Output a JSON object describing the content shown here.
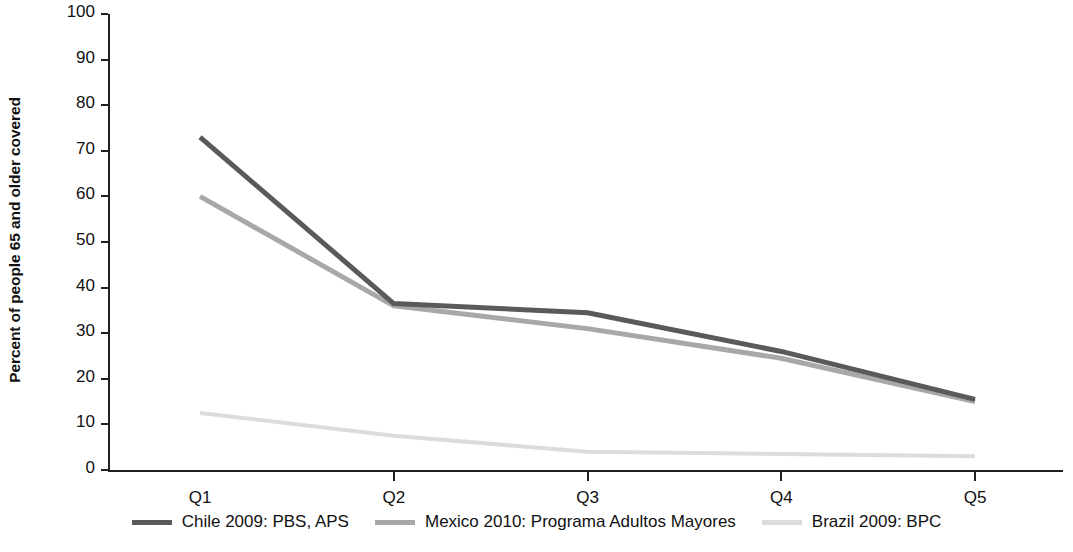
{
  "chart_data": {
    "type": "line",
    "title": "",
    "subtitle": "",
    "xlabel": "",
    "ylabel": "Percent of people 65 and older covered",
    "categories": [
      "Q1",
      "Q2",
      "Q3",
      "Q4",
      "Q5"
    ],
    "ylim": [
      0,
      100
    ],
    "yticks": [
      0,
      10,
      20,
      30,
      40,
      50,
      60,
      70,
      80,
      90,
      100
    ],
    "ytick_labels": [
      "0",
      "10",
      "20",
      "30",
      "40",
      "50",
      "60",
      "70",
      "80",
      "90",
      "100"
    ],
    "grid": false,
    "legend_position": "bottom",
    "series": [
      {
        "name": "Chile  2009: PBS, APS",
        "color": "#5a5a5a",
        "width": 5,
        "values": [
          73,
          36.5,
          34.5,
          26,
          15.5
        ]
      },
      {
        "name": "Mexico 2010: Programa Adultos Mayores",
        "color": "#a8a8a8",
        "width": 5,
        "values": [
          60,
          36,
          31,
          24.5,
          15
        ]
      },
      {
        "name": "Brazil 2009: BPC",
        "color": "#dcdcdc",
        "width": 4,
        "values": [
          12.5,
          7.5,
          4,
          3.5,
          3
        ]
      }
    ]
  },
  "axes": {
    "y_title": "Percent of people 65 and older covered"
  },
  "legend": {
    "items": [
      {
        "label": "Chile  2009: PBS, APS",
        "color": "#5a5a5a"
      },
      {
        "label": "Mexico 2010: Programa Adultos Mayores",
        "color": "#a8a8a8"
      },
      {
        "label": "Brazil 2009: BPC",
        "color": "#dcdcdc"
      }
    ]
  }
}
